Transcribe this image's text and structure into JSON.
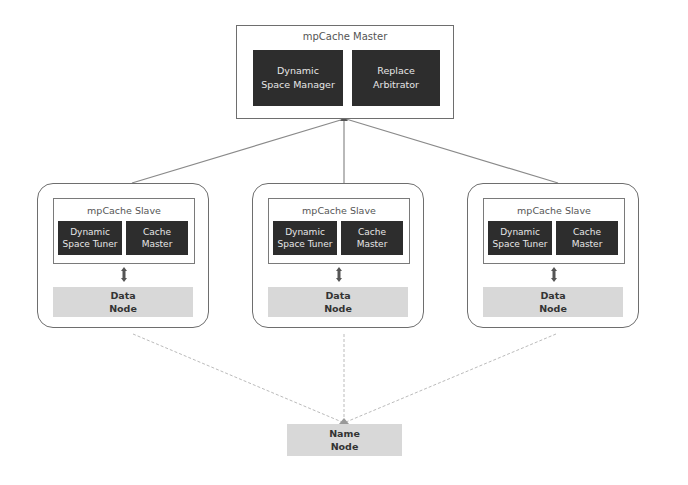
{
  "master": {
    "title": "mpCache Master",
    "components": [
      {
        "line1": "Dynamic",
        "line2": "Space Manager"
      },
      {
        "line1": "Replace",
        "line2": "Arbitrator"
      }
    ]
  },
  "slaves": [
    {
      "title": "mpCache Slave",
      "components": [
        {
          "line1": "Dynamic",
          "line2": "Space Tuner"
        },
        {
          "line1": "Cache",
          "line2": "Master"
        }
      ],
      "data_node": {
        "line1": "Data",
        "line2": "Node"
      }
    },
    {
      "title": "mpCache Slave",
      "components": [
        {
          "line1": "Dynamic",
          "line2": "Space Tuner"
        },
        {
          "line1": "Cache",
          "line2": "Master"
        }
      ],
      "data_node": {
        "line1": "Data",
        "line2": "Node"
      }
    },
    {
      "title": "mpCache Slave",
      "components": [
        {
          "line1": "Dynamic",
          "line2": "Space Tuner"
        },
        {
          "line1": "Cache",
          "line2": "Master"
        }
      ],
      "data_node": {
        "line1": "Data",
        "line2": "Node"
      }
    }
  ],
  "name_node": {
    "line1": "Name",
    "line2": "Node"
  },
  "colors": {
    "component_fill": "#2d2d2d",
    "node_fill": "#d8d8d8",
    "border": "#6e6e6e",
    "connector": "#8a8a8a"
  }
}
